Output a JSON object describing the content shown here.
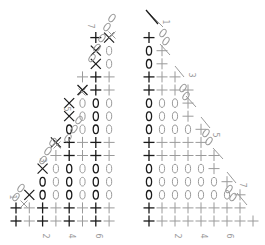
{
  "diagram": {
    "type": "crochet-stitch-chart",
    "colors": {
      "dark": "#1a1a1a",
      "light": "#9a9a9a",
      "background": "#ffffff"
    },
    "legend_symbols": {
      "+": "single crochet",
      "0": "chain",
      "X": "decrease",
      "chain-oval": "turning chain"
    },
    "left_chart": {
      "name": "left-triangle-chart",
      "column_labels": [
        {
          "col": 2,
          "text": "2"
        },
        {
          "col": 4,
          "text": "4"
        },
        {
          "col": 6,
          "text": "6"
        }
      ],
      "row_labels": [
        {
          "row": 3,
          "text": "1"
        },
        {
          "row": 7,
          "text": "3"
        },
        {
          "row": 11,
          "text": "5"
        },
        {
          "row": 15,
          "text": "7"
        }
      ],
      "rows": [
        {
          "row": 1,
          "start": 0,
          "cells": "++++++++"
        },
        {
          "row": 2,
          "start": 0,
          "cells": "++++++++"
        },
        {
          "row": 3,
          "start": 1,
          "cells": "X000000"
        },
        {
          "row": 4,
          "start": 2,
          "cells": "000000"
        },
        {
          "row": 5,
          "start": 2,
          "cells": "X00000"
        },
        {
          "row": 6,
          "start": 3,
          "cells": "+++++"
        },
        {
          "row": 7,
          "start": 3,
          "cells": "X++++"
        },
        {
          "row": 8,
          "start": 4,
          "cells": "0000"
        },
        {
          "row": 9,
          "start": 4,
          "cells": "X000"
        },
        {
          "row": 10,
          "start": 4,
          "cells": "X000"
        },
        {
          "row": 11,
          "start": 5,
          "cells": "X++"
        },
        {
          "row": 12,
          "start": 5,
          "cells": "+++"
        },
        {
          "row": 13,
          "start": 6,
          "cells": "X0"
        },
        {
          "row": 14,
          "start": 6,
          "cells": "X0"
        },
        {
          "row": 15,
          "start": 6,
          "cells": "+X"
        }
      ]
    },
    "right_chart": {
      "name": "right-triangle-chart",
      "column_labels": [
        {
          "col": 2,
          "text": "2"
        },
        {
          "col": 4,
          "text": "4"
        },
        {
          "col": 6,
          "text": "6"
        }
      ],
      "row_labels": [
        {
          "row": 15,
          "text": "1"
        },
        {
          "row": 11,
          "text": "3"
        },
        {
          "row": 7,
          "text": "5"
        },
        {
          "row": 3,
          "text": "7"
        }
      ],
      "rows": [
        {
          "row": 1,
          "cells": "+++++++++"
        },
        {
          "row": 2,
          "cells": "++++++++"
        },
        {
          "row": 3,
          "cells": "0000000+"
        },
        {
          "row": 4,
          "cells": "000000+"
        },
        {
          "row": 5,
          "cells": "00000+"
        },
        {
          "row": 6,
          "cells": "++++++"
        },
        {
          "row": 7,
          "cells": "+++++"
        },
        {
          "row": 8,
          "cells": "0000+"
        },
        {
          "row": 9,
          "cells": "000+"
        },
        {
          "row": 10,
          "cells": "000+"
        },
        {
          "row": 11,
          "cells": "++++"
        },
        {
          "row": 12,
          "cells": "+++"
        },
        {
          "row": 13,
          "cells": "0+"
        },
        {
          "row": 14,
          "cells": "0+"
        },
        {
          "row": 15,
          "cells": "+"
        }
      ]
    }
  }
}
